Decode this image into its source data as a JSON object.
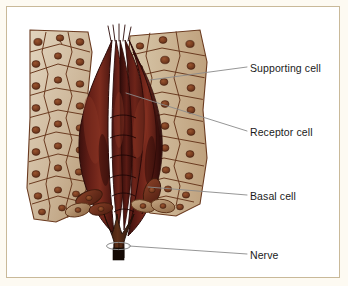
{
  "figure": {
    "frame_color": "#c9b999",
    "page_background": "#fdfaf2",
    "canvas_background": "#ffffff"
  },
  "palette": {
    "supporting_cell_fill": "#cdb79a",
    "supporting_cell_fill_light": "#ded0b8",
    "supporting_cell_outline": "#6b3b20",
    "supporting_cell_nucleus": "#7a3f22",
    "receptor_cell_fill": "#5a1a14",
    "receptor_cell_fill_dark": "#3d0f0c",
    "receptor_cell_fill_light": "#7b2a1d",
    "receptor_cell_outline": "#2b0a08",
    "basal_cell_fill": "#b89a78",
    "basal_cell_outline": "#5d3218",
    "nerve_fill": "#4a2414",
    "nerve_cut_end": "#1a0d07",
    "leader_line": "#8a8a8a",
    "label_text": "#1a1a1a"
  },
  "labels": {
    "supporting_cell": "Supporting cell",
    "receptor_cell": "Receptor cell",
    "basal_cell": "Basal cell",
    "nerve": "Nerve"
  },
  "callouts": [
    {
      "id": "supporting-cell",
      "text": "Supporting cell",
      "label_x": 250,
      "label_y": 68,
      "line_from_x": 247,
      "line_from_y": 67,
      "line_to_x": 150,
      "line_to_y": 80
    },
    {
      "id": "receptor-cell",
      "text": "Receptor cell",
      "label_x": 250,
      "label_y": 132,
      "line_from_x": 247,
      "line_from_y": 131,
      "line_to_x": 126,
      "line_to_y": 93
    },
    {
      "id": "basal-cell",
      "text": "Basal cell",
      "label_x": 250,
      "label_y": 196,
      "line_from_x": 247,
      "line_from_y": 195,
      "line_to_x": 148,
      "line_to_y": 187
    },
    {
      "id": "nerve",
      "text": "Nerve",
      "label_x": 250,
      "label_y": 255,
      "line_from_x": 247,
      "line_from_y": 254,
      "line_to_x": 117,
      "line_to_y": 245
    }
  ],
  "anatomy": {
    "structure_name": "Taste bud",
    "cell_types": [
      "Supporting cell",
      "Receptor cell",
      "Basal cell",
      "Nerve"
    ],
    "supporting_cell_count_left": 26,
    "supporting_cell_count_right": 26,
    "receptor_cell_count": 6,
    "basal_cell_count": 6,
    "nerve_fiber_count": 5
  }
}
